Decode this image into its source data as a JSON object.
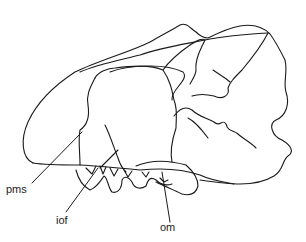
{
  "figure": {
    "type": "line-drawing",
    "labels": [
      {
        "id": "pms",
        "text": "pms",
        "x": 6,
        "y": 184
      },
      {
        "id": "iof",
        "text": "iof",
        "x": 56,
        "y": 215
      },
      {
        "id": "om",
        "text": "om",
        "x": 160,
        "y": 222
      }
    ],
    "colors": {
      "stroke": "#1a1a1a",
      "background": "#ffffff"
    }
  }
}
